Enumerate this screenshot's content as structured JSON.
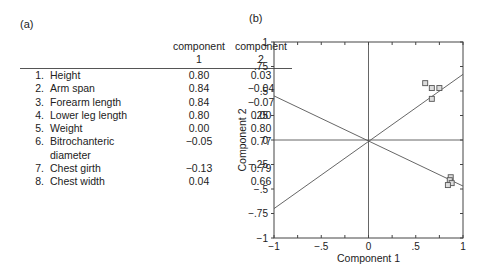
{
  "panel_a": {
    "label": "(a)",
    "headers": [
      {
        "line1": "",
        "line2": ""
      },
      {
        "line1": "component",
        "line2": "1"
      },
      {
        "line1": "component",
        "line2": "2"
      }
    ],
    "rows": [
      {
        "num": "1.",
        "name": "Height",
        "c1": "0.80",
        "c2": "0.03"
      },
      {
        "num": "2.",
        "name": "Arm span",
        "c1": "0.84",
        "c2": "−0.04"
      },
      {
        "num": "3.",
        "name": "Forearm length",
        "c1": "0.84",
        "c2": "−0.07"
      },
      {
        "num": "4.",
        "name": "Lower leg length",
        "c1": "0.80",
        "c2": "0.00"
      },
      {
        "num": "5.",
        "name": "Weight",
        "c1": "0.00",
        "c2": "0.80"
      },
      {
        "num": "6.",
        "name": "Bitrochanteric",
        "name2": "diameter",
        "c1": "−0.05",
        "c2": "0.77"
      },
      {
        "num": "7.",
        "name": "Chest girth",
        "c1": "−0.13",
        "c2": "0.79"
      },
      {
        "num": "8.",
        "name": "Chest width",
        "c1": "0.04",
        "c2": "0.66"
      }
    ]
  },
  "panel_b": {
    "label": "(b)"
  },
  "chart_data": [
    {
      "type": "table",
      "title": "(a)",
      "columns": [
        "",
        "component 1",
        "component 2"
      ],
      "rows": [
        [
          "1. Height",
          0.8,
          0.03
        ],
        [
          "2. Arm span",
          0.84,
          -0.04
        ],
        [
          "3. Forearm length",
          0.84,
          -0.07
        ],
        [
          "4. Lower leg length",
          0.8,
          0.0
        ],
        [
          "5. Weight",
          0.0,
          0.8
        ],
        [
          "6. Bitrochanteric diameter",
          -0.05,
          0.77
        ],
        [
          "7. Chest girth",
          -0.13,
          0.79
        ],
        [
          "8. Chest width",
          0.04,
          0.66
        ]
      ]
    },
    {
      "type": "scatter",
      "title": "(b)",
      "xlabel": "Component 1",
      "ylabel": "Component 2",
      "xlim": [
        -1,
        1
      ],
      "ylim": [
        -1,
        1
      ],
      "xticks": [
        "−1",
        "−.5",
        "0",
        ".5",
        "1"
      ],
      "yticks": [
        "1",
        ".75",
        ".5",
        ".25",
        "0",
        "−.25",
        "−.5",
        "−.75",
        "−1"
      ],
      "grid": false,
      "marker": "square",
      "series": [
        {
          "name": "cluster-upper",
          "points": [
            [
              0.6,
              0.58
            ],
            [
              0.67,
              0.53
            ],
            [
              0.75,
              0.53
            ],
            [
              0.67,
              0.42
            ]
          ]
        },
        {
          "name": "cluster-lower",
          "points": [
            [
              0.87,
              -0.38
            ],
            [
              0.86,
              -0.41
            ],
            [
              0.88,
              -0.44
            ],
            [
              0.84,
              -0.46
            ]
          ]
        }
      ],
      "reference_lines": [
        {
          "from": [
            -1,
            0.45
          ],
          "to": [
            1,
            -0.47
          ]
        },
        {
          "from": [
            -1,
            -0.7
          ],
          "to": [
            1,
            0.67
          ]
        },
        {
          "from": [
            -1,
            0
          ],
          "to": [
            1,
            0
          ]
        },
        {
          "from": [
            0,
            -1
          ],
          "to": [
            0,
            1
          ]
        }
      ]
    }
  ]
}
